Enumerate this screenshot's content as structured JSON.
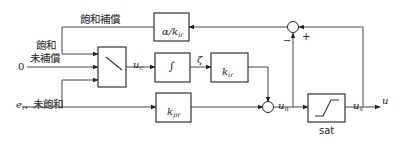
{
  "diagram": {
    "type": "control-block-diagram",
    "labels": {
      "saturation_compensation": "飽和補償",
      "saturated": "飽和",
      "not_compensated": "未補償",
      "zero_input": "0",
      "error_signal": "e",
      "error_signal_sub": "r",
      "not_saturated": "未飽和",
      "switch_output": "u",
      "switch_output_sub": "c",
      "integrator_output": "ζ",
      "unsat_output": "u",
      "unsat_output_sub": "n",
      "sat_output": "u",
      "sat_output_sub": "s",
      "final_output": "u",
      "sat_block_caption": "sat",
      "minus_sign": "−",
      "plus_sign": "+"
    },
    "blocks": {
      "anti_windup_gain": {
        "prefix": "α/k",
        "sub": "ir"
      },
      "integrator": {
        "symbol": "∫"
      },
      "integral_gain": {
        "prefix": "k",
        "sub": "ir"
      },
      "proportional_gain": {
        "prefix": "k",
        "sub": "pr"
      },
      "saturation": {
        "caption": "sat"
      }
    }
  }
}
